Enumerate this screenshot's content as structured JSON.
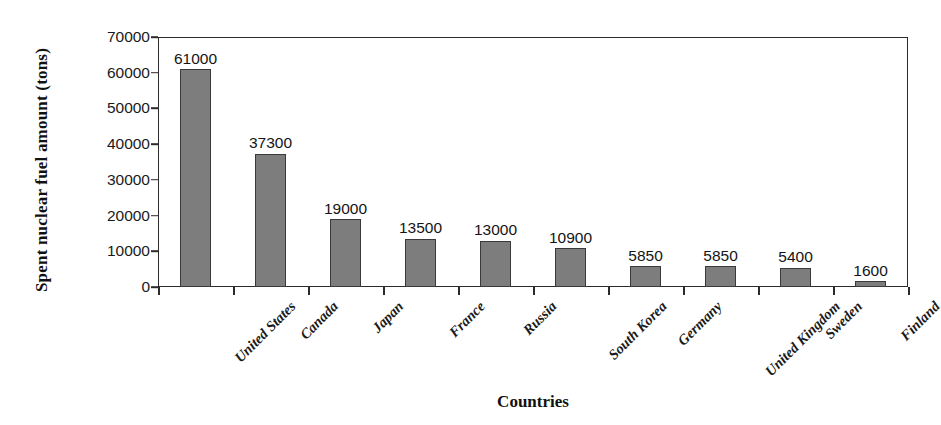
{
  "chart_data": {
    "type": "bar",
    "title": "",
    "xlabel": "Countries",
    "ylabel": "Spent nuclear fuel amount (tons)",
    "categories": [
      "United States",
      "Canada",
      "Japan",
      "France",
      "Russia",
      "South Korea",
      "Germany",
      "United Kingdom",
      "Sweden",
      "Finland"
    ],
    "values": [
      61000,
      37300,
      19000,
      13500,
      13000,
      10900,
      5850,
      5850,
      5400,
      1600
    ],
    "value_labels": [
      "61000",
      "37300",
      "19000",
      "13500",
      "13000",
      "10900",
      "5850",
      "5850",
      "5400",
      "1600"
    ],
    "ylim": [
      0,
      70000
    ],
    "ytick_values": [
      0,
      10000,
      20000,
      30000,
      40000,
      50000,
      60000,
      70000
    ],
    "ytick_labels": [
      "0",
      "10000",
      "20000",
      "30000",
      "40000",
      "50000",
      "60000",
      "70000"
    ],
    "grid": false,
    "legend": false,
    "bar_color": "#7d7d7d",
    "bar_edge_color": "#3a3a3a",
    "axis_color": "#2b2b2b",
    "background": "#ffffff"
  }
}
